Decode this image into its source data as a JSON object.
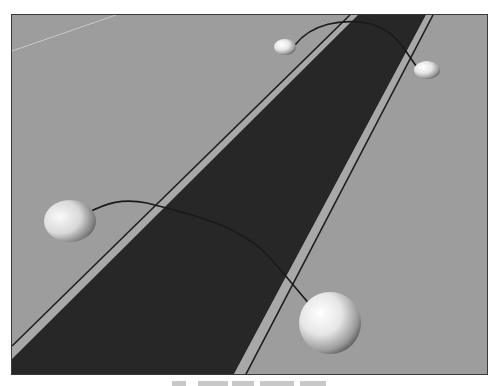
{
  "figure": {
    "colors": {
      "ground": "#9d9d9d",
      "road": "#272727",
      "shoulder": "#a8a8a8",
      "edge_line": "#1e1e1e",
      "arc": "#1a1a1a",
      "sphere_light": "#f4f4f4",
      "sphere_dark": "#4a4a4a",
      "faint_line": "#c8c8c8",
      "frame": "#3a3a3a"
    },
    "objects": {
      "near_pair": [
        "near-left-sphere",
        "near-right-sphere"
      ],
      "far_pair": [
        "far-left-sphere",
        "far-right-sphere"
      ]
    }
  },
  "caption": {
    "visible": "truncated",
    "text": ""
  }
}
